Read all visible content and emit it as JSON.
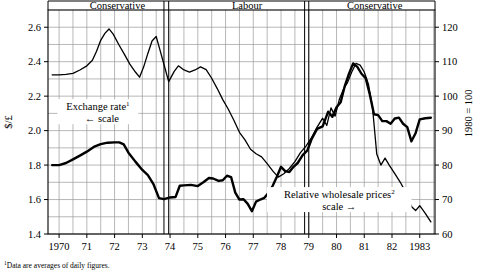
{
  "chart_data": {
    "type": "line",
    "title": "",
    "xlabel": "",
    "ylabel_left": "$/£",
    "ylabel_right": "1980 = 100",
    "xlim": [
      1969.6,
      1983.55
    ],
    "ylim_left": [
      1.4,
      2.7
    ],
    "ylim_right": [
      60,
      125
    ],
    "grid": true,
    "legend_position": "inline-annotations",
    "y_ticks_left": [
      "1.4",
      "1.6",
      "1.8",
      "2.0",
      "2.2",
      "2.4",
      "2.6"
    ],
    "y_tick_values_left": [
      1.4,
      1.6,
      1.8,
      2.0,
      2.2,
      2.4,
      2.6
    ],
    "y_ticks_right": [
      "60",
      "70",
      "80",
      "90",
      "100",
      "110",
      "120"
    ],
    "y_tick_values_right": [
      60,
      70,
      80,
      90,
      100,
      110,
      120
    ],
    "x_ticks": [
      "1970",
      "71",
      "72",
      "73",
      "74",
      "75",
      "76",
      "77",
      "78",
      "79",
      "80",
      "81",
      "82",
      "1983"
    ],
    "x_tick_values": [
      1970,
      1971,
      1972,
      1973,
      1974,
      1975,
      1976,
      1977,
      1978,
      1979,
      1980,
      1981,
      1982,
      1983
    ],
    "annotations": [
      {
        "name": "exchange-rate-label",
        "text": "Exchange rate",
        "sup": "1",
        "sub": "←  scale",
        "x": 1971.4,
        "y_left": 2.13
      },
      {
        "name": "wholesale-prices-label",
        "text": "Relative wholesale prices",
        "sup": "2",
        "sub": "scale  →",
        "x": 1980.1,
        "y_left": 1.62
      }
    ],
    "period_bands": [
      {
        "label": "Conservative",
        "start": 1970.0,
        "end": 1974.2
      },
      {
        "label": "Labour",
        "start": 1974.2,
        "end": 1979.35
      },
      {
        "label": "Conservative",
        "start": 1979.35,
        "end": 1983.4
      }
    ],
    "election_markers": [
      1973.78,
      1973.95,
      1978.85,
      1979.0
    ],
    "series": [
      {
        "name": "Exchange rate",
        "scale": "left",
        "units": "$/£",
        "stroke_width": 2.4,
        "points": [
          [
            1969.75,
            1.8
          ],
          [
            1970.0,
            1.8
          ],
          [
            1970.25,
            1.812
          ],
          [
            1970.5,
            1.833
          ],
          [
            1970.75,
            1.855
          ],
          [
            1971.0,
            1.878
          ],
          [
            1971.25,
            1.905
          ],
          [
            1971.5,
            1.922
          ],
          [
            1971.75,
            1.93
          ],
          [
            1972.0,
            1.932
          ],
          [
            1972.17,
            1.932
          ],
          [
            1972.33,
            1.92
          ],
          [
            1972.5,
            1.872
          ],
          [
            1972.75,
            1.82
          ],
          [
            1973.0,
            1.772
          ],
          [
            1973.2,
            1.742
          ],
          [
            1973.4,
            1.69
          ],
          [
            1973.6,
            1.608
          ],
          [
            1973.78,
            1.602
          ],
          [
            1974.0,
            1.612
          ],
          [
            1974.2,
            1.615
          ],
          [
            1974.35,
            1.68
          ],
          [
            1974.5,
            1.682
          ],
          [
            1974.75,
            1.685
          ],
          [
            1975.0,
            1.678
          ],
          [
            1975.2,
            1.7
          ],
          [
            1975.4,
            1.725
          ],
          [
            1975.55,
            1.722
          ],
          [
            1975.75,
            1.708
          ],
          [
            1975.9,
            1.712
          ],
          [
            1976.05,
            1.738
          ],
          [
            1976.2,
            1.73
          ],
          [
            1976.35,
            1.64
          ],
          [
            1976.5,
            1.6
          ],
          [
            1976.65,
            1.602
          ],
          [
            1976.8,
            1.575
          ],
          [
            1976.95,
            1.532
          ],
          [
            1977.1,
            1.588
          ],
          [
            1977.25,
            1.6
          ],
          [
            1977.4,
            1.61
          ],
          [
            1977.55,
            1.64
          ],
          [
            1977.7,
            1.68
          ],
          [
            1977.85,
            1.732
          ],
          [
            1978.0,
            1.79
          ],
          [
            1978.15,
            1.765
          ],
          [
            1978.3,
            1.76
          ],
          [
            1978.45,
            1.79
          ],
          [
            1978.6,
            1.812
          ],
          [
            1978.78,
            1.858
          ],
          [
            1978.95,
            1.885
          ],
          [
            1979.1,
            1.95
          ],
          [
            1979.3,
            2.01
          ],
          [
            1979.5,
            2.025
          ],
          [
            1979.7,
            2.11
          ],
          [
            1979.85,
            2.08
          ],
          [
            1980.0,
            2.135
          ],
          [
            1980.15,
            2.165
          ],
          [
            1980.3,
            2.26
          ],
          [
            1980.45,
            2.33
          ],
          [
            1980.6,
            2.39
          ],
          [
            1980.75,
            2.37
          ],
          [
            1980.9,
            2.33
          ],
          [
            1981.05,
            2.305
          ],
          [
            1981.2,
            2.21
          ],
          [
            1981.35,
            2.095
          ],
          [
            1981.5,
            2.09
          ],
          [
            1981.65,
            2.055
          ],
          [
            1981.8,
            2.055
          ],
          [
            1981.95,
            2.04
          ],
          [
            1982.1,
            2.07
          ],
          [
            1982.25,
            2.075
          ],
          [
            1982.4,
            2.04
          ],
          [
            1982.55,
            2.02
          ],
          [
            1982.7,
            1.938
          ],
          [
            1982.85,
            1.985
          ],
          [
            1983.0,
            2.065
          ],
          [
            1983.2,
            2.072
          ],
          [
            1983.4,
            2.075
          ]
        ]
      },
      {
        "name": "Relative wholesale prices",
        "scale": "right",
        "units": "1980 = 100",
        "stroke_width": 1.3,
        "points": [
          [
            1969.75,
            106.2
          ],
          [
            1970.0,
            106.2
          ],
          [
            1970.25,
            106.3
          ],
          [
            1970.5,
            106.6
          ],
          [
            1970.75,
            107.6
          ],
          [
            1971.0,
            108.8
          ],
          [
            1971.2,
            110.4
          ],
          [
            1971.35,
            113.0
          ],
          [
            1971.5,
            116.2
          ],
          [
            1971.65,
            118.2
          ],
          [
            1971.8,
            119.5
          ],
          [
            1971.95,
            118.0
          ],
          [
            1972.15,
            115.0
          ],
          [
            1972.35,
            112.2
          ],
          [
            1972.55,
            109.3
          ],
          [
            1972.75,
            107.0
          ],
          [
            1972.9,
            105.5
          ],
          [
            1973.05,
            108.5
          ],
          [
            1973.2,
            112.4
          ],
          [
            1973.35,
            116.0
          ],
          [
            1973.5,
            117.3
          ],
          [
            1973.65,
            113.0
          ],
          [
            1973.8,
            108.6
          ],
          [
            1973.95,
            104.2
          ],
          [
            1974.15,
            107.2
          ],
          [
            1974.3,
            108.8
          ],
          [
            1974.5,
            107.6
          ],
          [
            1974.7,
            107.0
          ],
          [
            1974.9,
            107.6
          ],
          [
            1975.1,
            108.5
          ],
          [
            1975.3,
            107.7
          ],
          [
            1975.5,
            105.2
          ],
          [
            1975.7,
            102.2
          ],
          [
            1975.9,
            99.0
          ],
          [
            1976.1,
            96.2
          ],
          [
            1976.3,
            93.0
          ],
          [
            1976.5,
            89.5
          ],
          [
            1976.7,
            87.3
          ],
          [
            1976.9,
            84.6
          ],
          [
            1977.1,
            83.3
          ],
          [
            1977.3,
            82.4
          ],
          [
            1977.5,
            80.4
          ],
          [
            1977.7,
            78.3
          ],
          [
            1977.9,
            76.5
          ],
          [
            1978.1,
            77.5
          ],
          [
            1978.3,
            79.0
          ],
          [
            1978.5,
            81.0
          ],
          [
            1978.7,
            83.6
          ],
          [
            1978.9,
            85.5
          ],
          [
            1979.1,
            88.0
          ],
          [
            1979.3,
            91.0
          ],
          [
            1979.5,
            93.6
          ],
          [
            1979.65,
            91.5
          ],
          [
            1979.8,
            96.6
          ],
          [
            1979.95,
            94.2
          ],
          [
            1980.1,
            99.0
          ],
          [
            1980.25,
            102.0
          ],
          [
            1980.4,
            104.0
          ],
          [
            1980.55,
            107.0
          ],
          [
            1980.7,
            109.5
          ],
          [
            1980.85,
            109.0
          ],
          [
            1981.0,
            107.0
          ],
          [
            1981.15,
            103.5
          ],
          [
            1981.3,
            96.5
          ],
          [
            1981.45,
            83.2
          ],
          [
            1981.6,
            80.0
          ],
          [
            1981.75,
            82.0
          ],
          [
            1981.9,
            80.0
          ],
          [
            1982.1,
            77.5
          ],
          [
            1982.3,
            75.0
          ],
          [
            1982.5,
            72.0
          ],
          [
            1982.7,
            68.0
          ],
          [
            1982.85,
            66.8
          ],
          [
            1983.0,
            68.2
          ],
          [
            1983.2,
            66.0
          ],
          [
            1983.4,
            63.5
          ]
        ]
      }
    ]
  },
  "footnotes": [
    {
      "marker": "1",
      "text": "Data are averages of daily figures."
    }
  ]
}
